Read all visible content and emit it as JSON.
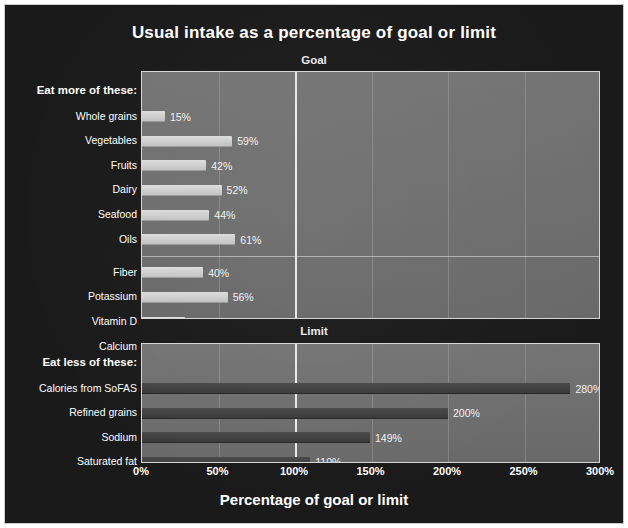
{
  "chart_data": {
    "type": "bar",
    "orientation": "horizontal",
    "title": "Usual intake as a percentage of goal or limit",
    "xlabel": "Percentage of goal or limit",
    "ylabel": "",
    "xlim": [
      0,
      300
    ],
    "xticks": [
      "0%",
      "50%",
      "100%",
      "150%",
      "200%",
      "250%",
      "300%"
    ],
    "xtick_values": [
      0,
      50,
      100,
      150,
      200,
      250,
      300
    ],
    "grid": true,
    "reference_line": 100,
    "legend": "none",
    "panels": [
      {
        "caption": "Goal",
        "heading": "Eat more of these:",
        "categories": [
          "Whole grains",
          "Vegetables",
          "Fruits",
          "Dairy",
          "Seafood",
          "Oils",
          "Fiber",
          "Potassium",
          "Vitamin D",
          "Calcium"
        ],
        "values": [
          15,
          59,
          42,
          52,
          44,
          61,
          40,
          56,
          28,
          75
        ],
        "labels": [
          "15%",
          "59%",
          "42%",
          "52%",
          "44%",
          "61%",
          "40%",
          "56%",
          "28%",
          "75%"
        ],
        "separator_after_index": 5
      },
      {
        "caption": "Limit",
        "heading": "Eat less of these:",
        "categories": [
          "Calories from SoFAS",
          "Refined grains",
          "Sodium",
          "Saturated fat"
        ],
        "values": [
          280,
          200,
          149,
          110
        ],
        "labels": [
          "280%",
          "200%",
          "149%",
          "110%"
        ],
        "separator_after_index": -1
      }
    ]
  },
  "colors": {
    "background": "#1a1a1a",
    "frame_border": "#c9c9c9",
    "plot_background": "#6f6f6f",
    "goal_bar": "#cfcfcf",
    "limit_bar": "#414141",
    "reference_line": "#e8e8e8",
    "text": "#ffffff"
  }
}
